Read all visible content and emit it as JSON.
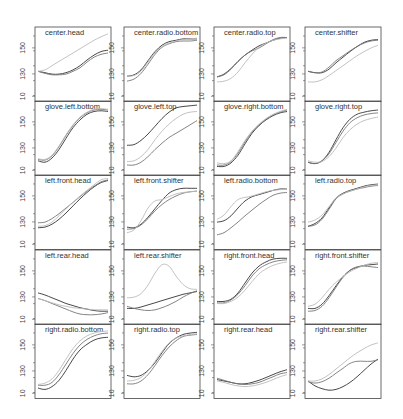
{
  "chart_data": {
    "type": "line",
    "layout": {
      "columns": 4,
      "rows": 5,
      "grid": false,
      "legend": "none"
    },
    "y_ticks": [
      "10",
      "130",
      "150"
    ],
    "y_tick_fraction": [
      0.07,
      0.37,
      0.72
    ],
    "series_names": [
      "dark",
      "medium",
      "light"
    ],
    "series_colors": [
      "#333333",
      "#777777",
      "#bbbbbb"
    ],
    "x": [
      0,
      0.1,
      0.2,
      0.3,
      0.4,
      0.5,
      0.6,
      0.7,
      0.8,
      0.9,
      1.0
    ],
    "panels": [
      {
        "title": "center.head",
        "series": [
          [
            0.4,
            0.38,
            0.36,
            0.36,
            0.38,
            0.42,
            0.48,
            0.56,
            0.63,
            0.68,
            0.7
          ],
          [
            0.4,
            0.37,
            0.35,
            0.35,
            0.36,
            0.4,
            0.45,
            0.53,
            0.6,
            0.64,
            0.66
          ],
          [
            0.4,
            0.42,
            0.48,
            0.54,
            0.6,
            0.66,
            0.72,
            0.78,
            0.84,
            0.89,
            0.93
          ]
        ]
      },
      {
        "title": "center.radio.bottom",
        "series": [
          [
            0.33,
            0.35,
            0.42,
            0.55,
            0.68,
            0.77,
            0.82,
            0.84,
            0.86,
            0.86,
            0.86
          ],
          [
            0.26,
            0.29,
            0.37,
            0.5,
            0.64,
            0.74,
            0.79,
            0.82,
            0.83,
            0.83,
            0.84
          ],
          [
            0.33,
            0.34,
            0.4,
            0.53,
            0.66,
            0.75,
            0.8,
            0.83,
            0.85,
            0.86,
            0.87
          ]
        ]
      },
      {
        "title": "center.radio.top",
        "series": [
          [
            0.32,
            0.36,
            0.44,
            0.54,
            0.63,
            0.7,
            0.76,
            0.8,
            0.84,
            0.87,
            0.88
          ],
          [
            0.32,
            0.35,
            0.43,
            0.54,
            0.63,
            0.69,
            0.73,
            0.79,
            0.85,
            0.88,
            0.88
          ],
          [
            0.25,
            0.26,
            0.3,
            0.39,
            0.52,
            0.64,
            0.74,
            0.8,
            0.84,
            0.86,
            0.87
          ]
        ]
      },
      {
        "title": "center.shifter",
        "series": [
          [
            0.4,
            0.38,
            0.38,
            0.43,
            0.52,
            0.6,
            0.68,
            0.75,
            0.81,
            0.84,
            0.85
          ],
          [
            0.4,
            0.38,
            0.39,
            0.46,
            0.55,
            0.62,
            0.69,
            0.75,
            0.8,
            0.83,
            0.84
          ],
          [
            0.25,
            0.25,
            0.28,
            0.34,
            0.41,
            0.48,
            0.55,
            0.62,
            0.68,
            0.73,
            0.77
          ]
        ]
      },
      {
        "title": "glove.left.bottom",
        "series": [
          [
            0.18,
            0.16,
            0.22,
            0.34,
            0.5,
            0.65,
            0.76,
            0.84,
            0.88,
            0.89,
            0.88
          ],
          [
            0.2,
            0.19,
            0.25,
            0.38,
            0.54,
            0.68,
            0.79,
            0.86,
            0.9,
            0.91,
            0.9
          ],
          [
            0.21,
            0.2,
            0.26,
            0.39,
            0.55,
            0.69,
            0.8,
            0.87,
            0.91,
            0.92,
            0.91
          ]
        ]
      },
      {
        "title": "glove.left.top",
        "series": [
          [
            0.4,
            0.41,
            0.47,
            0.56,
            0.67,
            0.78,
            0.87,
            0.93,
            0.95,
            0.96,
            0.97
          ],
          [
            0.12,
            0.12,
            0.16,
            0.24,
            0.34,
            0.43,
            0.51,
            0.57,
            0.63,
            0.69,
            0.75
          ],
          [
            0.17,
            0.18,
            0.24,
            0.34,
            0.48,
            0.6,
            0.7,
            0.78,
            0.84,
            0.87,
            0.88
          ]
        ]
      },
      {
        "title": "glove.right.bottom",
        "series": [
          [
            0.1,
            0.1,
            0.15,
            0.26,
            0.42,
            0.57,
            0.68,
            0.76,
            0.82,
            0.86,
            0.88
          ],
          [
            0.12,
            0.12,
            0.17,
            0.29,
            0.45,
            0.59,
            0.69,
            0.77,
            0.83,
            0.87,
            0.9
          ],
          [
            0.15,
            0.14,
            0.18,
            0.31,
            0.47,
            0.6,
            0.7,
            0.78,
            0.84,
            0.88,
            0.91
          ]
        ]
      },
      {
        "title": "glove.right.top",
        "series": [
          [
            0.16,
            0.14,
            0.18,
            0.3,
            0.48,
            0.65,
            0.77,
            0.84,
            0.87,
            0.89,
            0.9
          ],
          [
            0.16,
            0.14,
            0.18,
            0.28,
            0.44,
            0.6,
            0.72,
            0.79,
            0.83,
            0.85,
            0.86
          ],
          [
            0.18,
            0.16,
            0.17,
            0.24,
            0.36,
            0.51,
            0.62,
            0.7,
            0.75,
            0.78,
            0.8
          ]
        ]
      },
      {
        "title": "left.front.head",
        "series": [
          [
            0.28,
            0.29,
            0.33,
            0.4,
            0.49,
            0.59,
            0.69,
            0.78,
            0.86,
            0.92,
            0.95
          ],
          [
            0.35,
            0.36,
            0.41,
            0.48,
            0.56,
            0.64,
            0.72,
            0.8,
            0.87,
            0.93,
            0.96
          ],
          [
            0.3,
            0.31,
            0.36,
            0.45,
            0.55,
            0.64,
            0.73,
            0.81,
            0.89,
            0.96,
            0.98
          ]
        ]
      },
      {
        "title": "left.front.shifter",
        "series": [
          [
            0.29,
            0.28,
            0.33,
            0.43,
            0.55,
            0.67,
            0.77,
            0.82,
            0.84,
            0.84,
            0.84
          ],
          [
            0.26,
            0.27,
            0.32,
            0.41,
            0.52,
            0.61,
            0.68,
            0.73,
            0.77,
            0.79,
            0.8
          ],
          [
            0.21,
            0.25,
            0.38,
            0.56,
            0.66,
            0.68,
            0.72,
            0.76,
            0.78,
            0.79,
            0.8
          ]
        ]
      },
      {
        "title": "left.radio.bottom",
        "series": [
          [
            0.36,
            0.38,
            0.45,
            0.56,
            0.66,
            0.72,
            0.75,
            0.78,
            0.81,
            0.83,
            0.83
          ],
          [
            0.18,
            0.21,
            0.28,
            0.36,
            0.45,
            0.53,
            0.61,
            0.68,
            0.74,
            0.77,
            0.78
          ],
          [
            0.4,
            0.46,
            0.58,
            0.68,
            0.71,
            0.73,
            0.76,
            0.79,
            0.81,
            0.82,
            0.83
          ]
        ]
      },
      {
        "title": "left.radio.top",
        "series": [
          [
            0.3,
            0.34,
            0.42,
            0.56,
            0.7,
            0.77,
            0.81,
            0.84,
            0.87,
            0.89,
            0.9
          ],
          [
            0.3,
            0.32,
            0.4,
            0.54,
            0.69,
            0.76,
            0.8,
            0.83,
            0.85,
            0.87,
            0.88
          ],
          [
            0.36,
            0.39,
            0.46,
            0.58,
            0.7,
            0.76,
            0.8,
            0.83,
            0.86,
            0.88,
            0.89
          ]
        ]
      },
      {
        "title": "left.rear.head",
        "series": [
          [
            0.42,
            0.39,
            0.35,
            0.31,
            0.27,
            0.24,
            0.21,
            0.19,
            0.17,
            0.16,
            0.16
          ],
          [
            0.34,
            0.31,
            0.27,
            0.23,
            0.19,
            0.15,
            0.12,
            0.11,
            0.11,
            0.12,
            0.14
          ],
          [
            0.34,
            0.31,
            0.28,
            0.25,
            0.23,
            0.21,
            0.2,
            0.19,
            0.18,
            0.18,
            0.18
          ]
        ]
      },
      {
        "title": "left.rear.shifter",
        "series": [
          [
            0.2,
            0.2,
            0.22,
            0.25,
            0.28,
            0.31,
            0.34,
            0.37,
            0.4,
            0.42,
            0.44
          ],
          [
            0.23,
            0.2,
            0.18,
            0.17,
            0.18,
            0.21,
            0.25,
            0.3,
            0.36,
            0.41,
            0.45
          ],
          [
            0.35,
            0.36,
            0.41,
            0.53,
            0.7,
            0.82,
            0.8,
            0.66,
            0.54,
            0.48,
            0.47
          ]
        ]
      },
      {
        "title": "right.front.head",
        "series": [
          [
            0.3,
            0.3,
            0.33,
            0.42,
            0.56,
            0.7,
            0.8,
            0.86,
            0.9,
            0.91,
            0.91
          ],
          [
            0.28,
            0.28,
            0.32,
            0.4,
            0.52,
            0.66,
            0.76,
            0.82,
            0.86,
            0.88,
            0.89
          ],
          [
            0.27,
            0.27,
            0.3,
            0.36,
            0.46,
            0.58,
            0.69,
            0.76,
            0.81,
            0.84,
            0.86
          ]
        ]
      },
      {
        "title": "right.front.shifter",
        "series": [
          [
            0.2,
            0.2,
            0.26,
            0.38,
            0.52,
            0.65,
            0.74,
            0.78,
            0.81,
            0.82,
            0.83
          ],
          [
            0.16,
            0.17,
            0.23,
            0.35,
            0.5,
            0.64,
            0.74,
            0.79,
            0.8,
            0.79,
            0.78
          ],
          [
            0.23,
            0.26,
            0.35,
            0.47,
            0.57,
            0.65,
            0.72,
            0.77,
            0.81,
            0.84,
            0.85
          ]
        ]
      },
      {
        "title": "right.radio.bottom",
        "series": [
          [
            0.12,
            0.1,
            0.14,
            0.23,
            0.37,
            0.53,
            0.66,
            0.74,
            0.8,
            0.83,
            0.84
          ],
          [
            0.16,
            0.16,
            0.2,
            0.31,
            0.46,
            0.61,
            0.73,
            0.81,
            0.86,
            0.89,
            0.9
          ],
          [
            0.17,
            0.19,
            0.25,
            0.37,
            0.53,
            0.68,
            0.79,
            0.86,
            0.9,
            0.92,
            0.93
          ]
        ]
      },
      {
        "title": "right.radio.top",
        "series": [
          [
            0.3,
            0.28,
            0.3,
            0.37,
            0.48,
            0.62,
            0.75,
            0.83,
            0.88,
            0.9,
            0.91
          ],
          [
            0.18,
            0.18,
            0.22,
            0.31,
            0.44,
            0.58,
            0.7,
            0.79,
            0.85,
            0.87,
            0.88
          ],
          [
            0.22,
            0.23,
            0.27,
            0.36,
            0.5,
            0.64,
            0.76,
            0.83,
            0.86,
            0.88,
            0.89
          ]
        ]
      },
      {
        "title": "right.rear.head",
        "series": [
          [
            0.24,
            0.22,
            0.2,
            0.18,
            0.18,
            0.2,
            0.23,
            0.27,
            0.31,
            0.35,
            0.38
          ],
          [
            0.26,
            0.23,
            0.2,
            0.18,
            0.17,
            0.18,
            0.2,
            0.24,
            0.28,
            0.32,
            0.34
          ],
          [
            0.22,
            0.2,
            0.17,
            0.15,
            0.14,
            0.15,
            0.17,
            0.2,
            0.24,
            0.28,
            0.31
          ]
        ]
      },
      {
        "title": "right.rear.shifter",
        "series": [
          [
            0.22,
            0.15,
            0.11,
            0.09,
            0.1,
            0.14,
            0.2,
            0.28,
            0.37,
            0.46,
            0.53
          ],
          [
            0.21,
            0.19,
            0.21,
            0.26,
            0.33,
            0.4,
            0.47,
            0.5,
            0.5,
            0.5,
            0.52
          ],
          [
            0.22,
            0.22,
            0.25,
            0.31,
            0.39,
            0.47,
            0.55,
            0.62,
            0.68,
            0.73,
            0.76
          ]
        ]
      }
    ]
  }
}
